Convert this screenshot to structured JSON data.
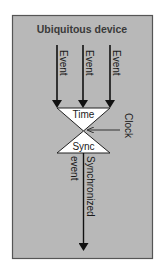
{
  "diagram": {
    "container_label": "Ubiquitous device",
    "input_events": [
      {
        "label": "Event"
      },
      {
        "label": "Event"
      },
      {
        "label": "Event"
      }
    ],
    "time_label": "Time",
    "sync_label": "Sync",
    "clock_label": "Clock",
    "output_label_right": "Synchronized",
    "output_label_left": "event",
    "colors": {
      "container_fill": "#b8b8b8",
      "container_border": "#555555",
      "shape_fill": "#ffffff",
      "stroke": "#111111"
    }
  }
}
